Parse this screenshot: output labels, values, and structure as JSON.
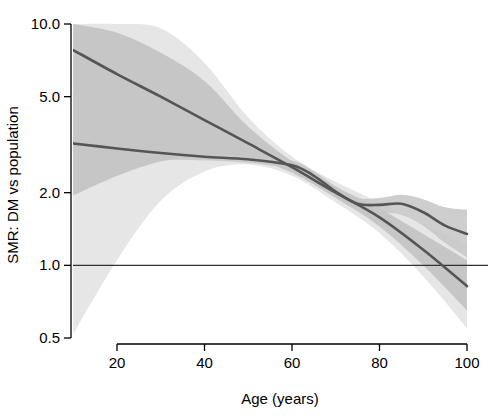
{
  "chart_data": {
    "type": "line",
    "title": "",
    "xlabel": "Age (years)",
    "ylabel": "SMR: DM vs population",
    "xlim": [
      10,
      100
    ],
    "ylim": [
      0.5,
      10.0
    ],
    "yscale": "log",
    "grid": false,
    "legend": "none",
    "xticks": [
      20,
      40,
      60,
      80,
      100
    ],
    "xtick_labels": [
      "20",
      "40",
      "60",
      "80",
      "100"
    ],
    "yticks": [
      0.5,
      1.0,
      2.0,
      5.0,
      10.0
    ],
    "ytick_labels": [
      "0.5",
      "1.0",
      "2.0",
      "5.0",
      "10.0"
    ],
    "reference_line": {
      "y": 1.0,
      "label": "1.0",
      "color": "#333333"
    },
    "colors": {
      "curve": "#555555",
      "band_inner": "#c6c6c6",
      "band_outer": "#e6e6e6",
      "axis": "#000000",
      "reference": "#333333"
    },
    "series": [
      {
        "name": "steep-trend",
        "x": [
          10,
          20,
          30,
          40,
          50,
          60,
          70,
          80,
          90,
          100
        ],
        "y": [
          7.8,
          6.2,
          5.0,
          4.0,
          3.2,
          2.55,
          2.0,
          1.58,
          1.16,
          0.82
        ],
        "band_inner_lower": [
          1.95,
          2.35,
          2.7,
          2.85,
          2.8,
          2.42,
          1.9,
          1.45,
          1.0,
          0.65
        ],
        "band_inner_upper": [
          10.0,
          9.2,
          7.6,
          5.8,
          3.75,
          2.7,
          2.12,
          1.72,
          1.35,
          1.05
        ],
        "band_outer_lower": [
          0.52,
          1.05,
          1.85,
          2.45,
          2.62,
          2.35,
          1.82,
          1.36,
          0.9,
          0.55
        ],
        "band_outer_upper": [
          10.0,
          10.0,
          9.6,
          6.9,
          4.1,
          2.82,
          2.22,
          1.82,
          1.48,
          1.22
        ]
      },
      {
        "name": "flat-trend",
        "x": [
          10,
          20,
          30,
          40,
          50,
          60,
          65,
          70,
          75,
          80,
          85,
          90,
          95,
          100
        ],
        "y": [
          3.2,
          3.05,
          2.92,
          2.82,
          2.75,
          2.6,
          2.35,
          2.02,
          1.8,
          1.78,
          1.8,
          1.66,
          1.46,
          1.35
        ],
        "band_inner_lower": [
          1.95,
          2.35,
          2.7,
          2.72,
          2.66,
          2.5,
          2.25,
          1.95,
          1.72,
          1.66,
          1.62,
          1.46,
          1.24,
          1.08
        ],
        "band_inner_upper": [
          5.3,
          4.1,
          3.2,
          2.95,
          2.86,
          2.72,
          2.46,
          2.12,
          1.9,
          1.9,
          1.96,
          1.88,
          1.74,
          1.7
        ]
      }
    ],
    "annotations": [
      {
        "text": "confidence band (inner, darker gray)"
      },
      {
        "text": "confidence band (outer, lighter gray)"
      }
    ]
  },
  "axes": {
    "x_title": "Age (years)",
    "y_title": "SMR: DM vs population"
  }
}
